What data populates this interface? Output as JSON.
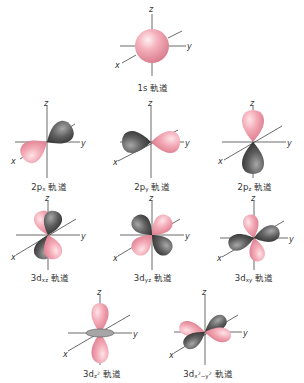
{
  "colors": {
    "positive_lobe": "#f2a3b0",
    "negative_lobe": "#5a5a5a",
    "axis": "#444444",
    "text": "#333333",
    "nodal_ring": "#9a9a9a"
  },
  "axis_labels": {
    "x": "x",
    "y": "y",
    "z": "z"
  },
  "suffix": "軌道",
  "orbitals": [
    {
      "id": "1s",
      "main": "1s",
      "sub": "",
      "sup": "",
      "suffix": "軌道"
    },
    {
      "id": "2px",
      "main": "2p",
      "sub": "x",
      "sup": "",
      "suffix": "軌道"
    },
    {
      "id": "2py",
      "main": "2p",
      "sub": "y",
      "sup": "",
      "suffix": "軌道"
    },
    {
      "id": "2pz",
      "main": "2p",
      "sub": "z",
      "sup": "",
      "suffix": "軌道"
    },
    {
      "id": "3dxz",
      "main": "3d",
      "sub": "xz",
      "sup": "",
      "suffix": "軌道"
    },
    {
      "id": "3dyz",
      "main": "3d",
      "sub": "yz",
      "sup": "",
      "suffix": "軌道"
    },
    {
      "id": "3dxy",
      "main": "3d",
      "sub": "xy",
      "sup": "",
      "suffix": "軌道"
    },
    {
      "id": "3dz2",
      "main": "3d",
      "sub": "z",
      "sup": "2",
      "suffix": "軌道"
    },
    {
      "id": "3dx2-y2",
      "main": "3d",
      "sub": "x",
      "sup": "2",
      "sub2": "−y",
      "sup2": "2",
      "suffix": "軌道"
    }
  ]
}
